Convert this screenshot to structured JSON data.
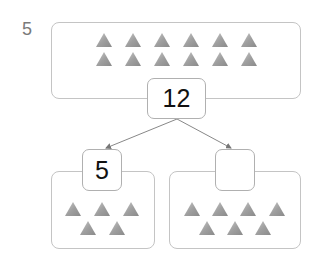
{
  "problem": {
    "number": "5"
  },
  "whole": {
    "value": "12",
    "triangle_count": 12
  },
  "parts": [
    {
      "value": "5",
      "triangle_count": 5
    },
    {
      "value": "",
      "triangle_count": 7
    }
  ],
  "colors": {
    "triangle": "#9a9a9a",
    "border": "#c4c4c4",
    "arrow": "#777777",
    "problem_number": "#7a7a7a"
  }
}
